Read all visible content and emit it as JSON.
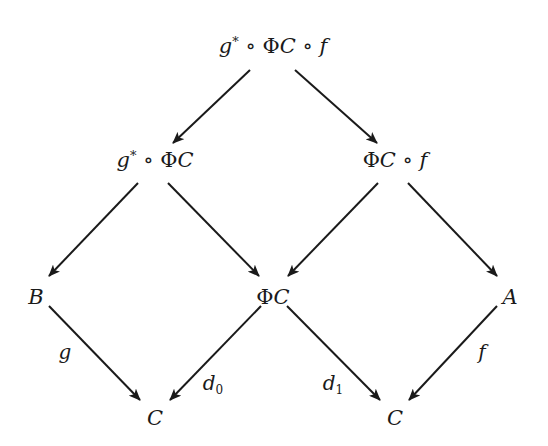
{
  "diagram": {
    "type": "commutative-diagram",
    "nodes": {
      "top": {
        "id": "top",
        "text": "g* ∘ ΦC ∘ f",
        "x": 273,
        "y": 46
      },
      "mid_left": {
        "id": "mid_left",
        "text": "g* ∘ ΦC",
        "x": 155,
        "y": 160
      },
      "mid_right": {
        "id": "mid_right",
        "text": "ΦC ∘ f",
        "x": 395,
        "y": 160
      },
      "B": {
        "id": "B",
        "text": "B",
        "x": 36,
        "y": 297
      },
      "center": {
        "id": "center",
        "text": "ΦC",
        "x": 273,
        "y": 297
      },
      "A": {
        "id": "A",
        "text": "A",
        "x": 510,
        "y": 297
      },
      "C_left": {
        "id": "C_left",
        "text": "C",
        "x": 155,
        "y": 418
      },
      "C_right": {
        "id": "C_right",
        "text": "C",
        "x": 395,
        "y": 418
      }
    },
    "edges": [
      {
        "from": "top",
        "to": "mid_left",
        "label": ""
      },
      {
        "from": "top",
        "to": "mid_right",
        "label": ""
      },
      {
        "from": "mid_left",
        "to": "B",
        "label": ""
      },
      {
        "from": "mid_left",
        "to": "center",
        "label": ""
      },
      {
        "from": "mid_right",
        "to": "center",
        "label": ""
      },
      {
        "from": "mid_right",
        "to": "A",
        "label": ""
      },
      {
        "from": "B",
        "to": "C_left",
        "label": "g"
      },
      {
        "from": "center",
        "to": "C_left",
        "label": "d0"
      },
      {
        "from": "center",
        "to": "C_right",
        "label": "d1"
      },
      {
        "from": "A",
        "to": "C_right",
        "label": "f"
      }
    ],
    "labels": {
      "g": {
        "base": "g",
        "sub": "",
        "x": 65,
        "y": 352
      },
      "d0": {
        "base": "d",
        "sub": "0",
        "x": 213,
        "y": 384
      },
      "d1": {
        "base": "d",
        "sub": "1",
        "x": 333,
        "y": 384
      },
      "f": {
        "base": "f",
        "sub": "",
        "x": 482,
        "y": 352
      }
    },
    "symbols": {
      "g": "g",
      "star": "*",
      "compose": "∘",
      "Phi": "Φ",
      "C": "C",
      "f": "f",
      "A": "A",
      "B": "B"
    },
    "colors": {
      "ink": "#1a1a1a",
      "background": "#ffffff"
    }
  }
}
